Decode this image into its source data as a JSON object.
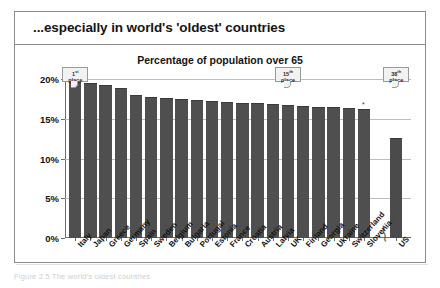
{
  "slide": {
    "title": "...especially in world's 'oldest' countries",
    "footer_caption": "Figure 2.5  The world's oldest countries"
  },
  "chart_data": {
    "type": "bar",
    "title": "Percentage of population over 65",
    "xlabel": "",
    "ylabel": "",
    "ylim": [
      0,
      20
    ],
    "grid": true,
    "legend_position": "none",
    "ytick_labels": [
      "0%",
      "5%",
      "10%",
      "15%",
      "20%"
    ],
    "ytick_values": [
      0,
      5,
      10,
      15,
      20
    ],
    "axis_break_before_last": true,
    "categories": [
      "Italy",
      "Japan",
      "Greece",
      "Germany",
      "Spain",
      "Sweden",
      "Belgium",
      "Bulgaria",
      "Portugal",
      "Estonia",
      "France",
      "Croatia",
      "Austria",
      "Latvia",
      "UK",
      "Finland",
      "Georgia",
      "Ukraine",
      "Switzerland",
      "Slovenia",
      "US"
    ],
    "values": [
      19.5,
      19.4,
      19.1,
      18.8,
      17.9,
      17.6,
      17.5,
      17.4,
      17.2,
      17.1,
      17.0,
      16.9,
      16.8,
      16.7,
      16.6,
      16.5,
      16.4,
      16.3,
      16.2,
      16.1,
      12.5
    ],
    "annotations": [
      {
        "label_line1": "1st",
        "label_line2": "place",
        "points_to": "Italy"
      },
      {
        "label_line1": "15th",
        "label_line2": "place",
        "points_to": "UK"
      },
      {
        "label_line1": "38th",
        "label_line2": "place",
        "points_to": "US"
      }
    ]
  }
}
